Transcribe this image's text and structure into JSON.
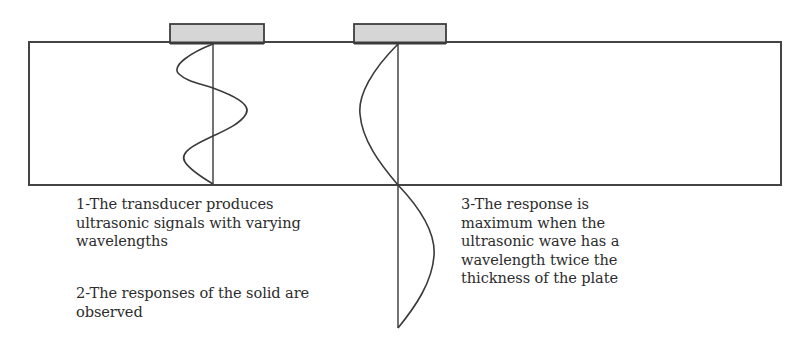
{
  "diagram": {
    "colors": {
      "stroke": "#3a3a3a",
      "transducer_fill": "#d6d6d6",
      "transducer_base": "#4a4a4a",
      "text": "#2d2d2d",
      "background": "#ffffff"
    },
    "plate": {
      "x": 29,
      "y": 42,
      "width": 752,
      "height": 143
    },
    "transducers": [
      {
        "id": "transducer-left",
        "x": 170,
        "y": 24,
        "width": 94,
        "height": 20
      },
      {
        "id": "transducer-right",
        "x": 354,
        "y": 24,
        "width": 92,
        "height": 20
      }
    ],
    "waves": [
      {
        "id": "varying-wavelength-wave",
        "axis_x": 213,
        "y_start": 44,
        "y_end": 183,
        "wavelengths": 1.5,
        "description": "short-wavelength signal inside plate"
      },
      {
        "id": "resonant-wave",
        "axis_x": 398,
        "y_start": 44,
        "y_end": 328,
        "wavelengths": 1.0,
        "description": "wavelength equal to twice the plate thickness"
      }
    ]
  },
  "captions": {
    "step1": {
      "lines": [
        "1-The transducer produces",
        "ultrasonic signals with varying",
        "wavelengths"
      ]
    },
    "step2": {
      "lines": [
        "2-The responses of the solid are",
        "observed"
      ]
    },
    "step3": {
      "lines": [
        "3-The response is",
        "maximum when the",
        "ultrasonic wave has a",
        "wavelength twice the",
        "thickness of the plate"
      ]
    }
  }
}
